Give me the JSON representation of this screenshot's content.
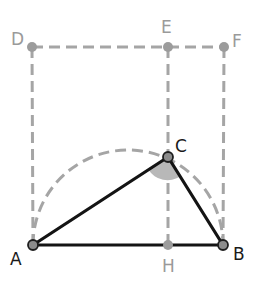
{
  "diagram": {
    "type": "geometry",
    "points": {
      "A": {
        "label": "A",
        "x": 33,
        "y": 245
      },
      "B": {
        "label": "B",
        "x": 223,
        "y": 245
      },
      "C": {
        "label": "C",
        "x": 168,
        "y": 157
      },
      "D": {
        "label": "D",
        "x": 32,
        "y": 47
      },
      "E": {
        "label": "E",
        "x": 168,
        "y": 47
      },
      "F": {
        "label": "F",
        "x": 224,
        "y": 47
      },
      "H": {
        "label": "H",
        "x": 168,
        "y": 245
      }
    },
    "solid_segments": [
      "AB",
      "AC",
      "CB"
    ],
    "dashed_segments": [
      "DF",
      "DA",
      "FB",
      "EH"
    ],
    "dashed_arcs": [
      {
        "name": "semicircle-AB",
        "center": [
          128,
          245
        ],
        "radius": 95
      }
    ],
    "angle_marks": [
      {
        "vertex": "C",
        "between": [
          "A",
          "B"
        ],
        "style": "filled-sector"
      }
    ],
    "colors": {
      "solid_line": "#141414",
      "dashed_line": "#a5a5a5",
      "angle_fill": "#b8b8b8",
      "label_dark": "#1a1a1a",
      "label_gray": "#9a9a9a"
    }
  },
  "labels": {
    "A": "A",
    "B": "B",
    "C": "C",
    "D": "D",
    "E": "E",
    "F": "F",
    "H": "H"
  }
}
